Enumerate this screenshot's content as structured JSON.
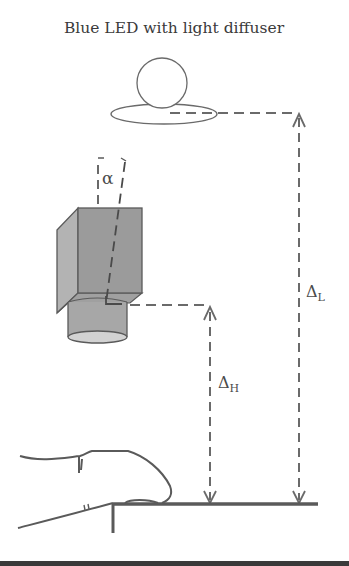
{
  "figure": {
    "title": "Blue LED with light diffuser",
    "labels": {
      "angle": "α",
      "delta_h_symbol": "Δ",
      "delta_h_sub": "H",
      "delta_l_symbol": "Δ",
      "delta_l_sub": "L"
    },
    "components": [
      {
        "id": "led",
        "name": "Blue LED with light diffuser"
      },
      {
        "id": "camera",
        "name": "Camera (tilted by angle α)"
      },
      {
        "id": "finger",
        "name": "Finger on platform"
      },
      {
        "id": "platform",
        "name": "Platform / table surface"
      }
    ],
    "dimensions": [
      {
        "id": "delta_h",
        "label": "ΔH",
        "from": "camera lens",
        "to": "platform"
      },
      {
        "id": "delta_l",
        "label": "ΔL",
        "from": "LED diffuser",
        "to": "platform"
      }
    ],
    "colors": {
      "stroke": "#5a5a5a",
      "camera_fill": "#9a9a9a",
      "camera_side": "#b5b5b5",
      "lens_fill": "#a8a8a8",
      "lens_bottom": "#d4d4d4",
      "text": "#3a3a3a",
      "bottom_bar": "#3a3a3a"
    }
  }
}
